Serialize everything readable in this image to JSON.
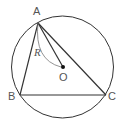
{
  "diagram": {
    "type": "geometry",
    "colors": {
      "stroke": "#333333",
      "label": "#555555",
      "arc": "#777777"
    },
    "circle": {
      "cx": 62.5,
      "cy": 67,
      "r": 51
    },
    "points": {
      "A": {
        "x": 38,
        "y": 23,
        "label": "A"
      },
      "B": {
        "x": 20,
        "y": 95,
        "label": "B"
      },
      "C": {
        "x": 106,
        "y": 95,
        "label": "C"
      },
      "O": {
        "x": 63,
        "y": 67,
        "label": "O"
      }
    },
    "segments": [
      "AB",
      "BC",
      "CA",
      "AO"
    ],
    "radius_label": "R"
  }
}
